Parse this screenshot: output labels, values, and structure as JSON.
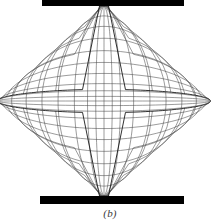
{
  "figure": {
    "caption": "(b)",
    "kind": "deformed-finite-element-mesh",
    "canvas": {
      "width": 220,
      "height": 224
    },
    "colors": {
      "background": "#ffffff",
      "outline": "#1a1a1a",
      "mesh_line": "#4a4a4a",
      "platen_fill": "#000000",
      "caption_text": "#3a3a3a"
    }
  },
  "specimen": {
    "name": "disc-outline",
    "center_x": 104,
    "center_y": 101,
    "radius_x": 100,
    "radius_y": 97,
    "outline_width": 0.9,
    "flat_top_y": 6,
    "flat_bottom_y": 196
  },
  "platens": [
    {
      "name": "top-platen",
      "position": "top",
      "x": 42,
      "y": 0,
      "width": 142,
      "height": 6
    },
    {
      "name": "bottom-platen",
      "position": "bottom",
      "x": 40,
      "y": 196,
      "width": 144,
      "height": 8
    }
  ],
  "chart_data": {
    "type": "mesh",
    "title": "",
    "xlabel": "",
    "ylabel": "",
    "grid": true,
    "legend": null,
    "mesh": {
      "line_width": 0.55,
      "columns_count": 17,
      "rows_count": 19,
      "column_u": [
        -1.0,
        -0.86,
        -0.72,
        -0.57,
        -0.42,
        -0.27,
        -0.15,
        -0.075,
        0.0,
        0.075,
        0.15,
        0.27,
        0.42,
        0.57,
        0.72,
        0.86,
        1.0
      ],
      "row_v": [
        -1.0,
        -0.88,
        -0.76,
        -0.63,
        -0.5,
        -0.38,
        -0.27,
        -0.17,
        -0.1,
        -0.045,
        0.0,
        0.045,
        0.1,
        0.17,
        0.27,
        0.38,
        0.5,
        0.63,
        0.76,
        0.88,
        1.0
      ],
      "bulge_x": 0.1,
      "bulge_y": 0.08
    }
  }
}
